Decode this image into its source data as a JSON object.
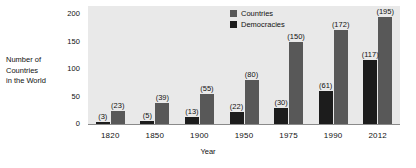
{
  "chart_data": {
    "type": "bar",
    "title": "",
    "xlabel": "Year",
    "ylabel": "Number of Countries in the World",
    "ylabel_lines": [
      "Number of",
      "Countries",
      "in the World"
    ],
    "categories": [
      "1820",
      "1850",
      "1900",
      "1950",
      "1975",
      "1990",
      "2012"
    ],
    "series": [
      {
        "name": "Democracies",
        "color": "#1c1c1c",
        "values": [
          3,
          5,
          13,
          22,
          30,
          61,
          117
        ],
        "labels": [
          "(3)",
          "(5)",
          "(13)",
          "(22)",
          "(30)",
          "(61)",
          "(117)"
        ]
      },
      {
        "name": "Countries",
        "color": "#585858",
        "values": [
          23,
          39,
          55,
          80,
          150,
          172,
          195
        ],
        "labels": [
          "(23)",
          "(39)",
          "(55)",
          "(80)",
          "(150)",
          "(172)",
          "(195)"
        ]
      }
    ],
    "yticks": [
      0,
      50,
      100,
      150,
      200
    ],
    "ytick_labels": [
      "0",
      "50",
      "100",
      "150",
      "200"
    ],
    "ylim": [
      0,
      215
    ],
    "grid": false,
    "legend_position": "top-center",
    "legend": [
      {
        "label": "Countries",
        "color": "#585858"
      },
      {
        "label": "Democracies",
        "color": "#1c1c1c"
      }
    ],
    "plot_background": "#e9e9e9",
    "page_background": "#ffffff"
  }
}
